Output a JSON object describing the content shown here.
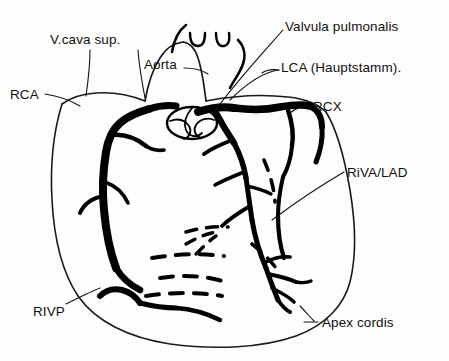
{
  "figure": {
    "style": {
      "background_color": "#fdfdfb",
      "ink_color": "#111111",
      "outline_color": "#1a1a1a",
      "vessel_color": "#000000"
    }
  },
  "labels": {
    "vcava_sup": "V.cava sup.",
    "aorta": "Aorta",
    "valvula_pulmonalis": "Valvula pulmonalis",
    "lca": "LCA (Hauptstamm).",
    "rca": "RCA",
    "rcx": "RCX",
    "riva_lad": "RiVA/LAD",
    "rivp": "RIVP",
    "apex_cordis": "Apex cordis"
  },
  "structures": [
    {
      "name": "superior-vena-cava",
      "label_key": "vcava_sup"
    },
    {
      "name": "aorta",
      "label_key": "aorta"
    },
    {
      "name": "pulmonary-valve",
      "label_key": "valvula_pulmonalis"
    },
    {
      "name": "left-coronary-artery-main-stem",
      "label_key": "lca"
    },
    {
      "name": "right-coronary-artery",
      "label_key": "rca"
    },
    {
      "name": "ramus-circumflexus",
      "label_key": "rcx"
    },
    {
      "name": "left-anterior-descending-artery",
      "label_key": "riva_lad"
    },
    {
      "name": "posterior-descending-artery",
      "label_key": "rivp"
    },
    {
      "name": "apex-of-heart",
      "label_key": "apex_cordis"
    }
  ]
}
